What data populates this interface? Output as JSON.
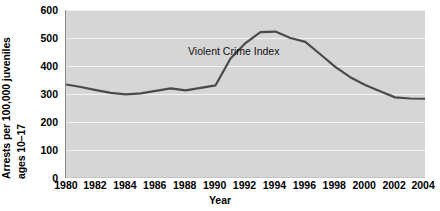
{
  "chart_data": {
    "type": "line",
    "title": "",
    "xlabel": "Year",
    "ylabel_lines": [
      "Arrests per 100,000 juveniles",
      "ages 10–17"
    ],
    "ylabel": "Arrests per 100,000 juveniles ages 10–17",
    "xlim": [
      1980,
      2004
    ],
    "ylim": [
      0,
      600
    ],
    "yticks": [
      600,
      500,
      400,
      300,
      200,
      100,
      0
    ],
    "ytick_labels": [
      "600",
      "500",
      "400",
      "300",
      "200",
      "100",
      "0"
    ],
    "xticks": [
      1980,
      1982,
      1984,
      1986,
      1988,
      1990,
      1992,
      1994,
      1996,
      1998,
      2000,
      2002,
      2004
    ],
    "xtick_labels": [
      "1980",
      "1982",
      "1984",
      "1986",
      "1988",
      "1990",
      "1992",
      "1994",
      "1996",
      "1998",
      "2000",
      "2002",
      "2004"
    ],
    "grid": "horizontal-white-gridlines",
    "legend": "none",
    "annotations": [
      {
        "text": "Violent Crime Index",
        "x": 1986,
        "y": 470
      }
    ],
    "series": [
      {
        "name": "Violent Crime Index",
        "color": "#4a4a4a",
        "x": [
          1980,
          1981,
          1982,
          1983,
          1984,
          1985,
          1986,
          1987,
          1988,
          1989,
          1990,
          1991,
          1992,
          1993,
          1994,
          1995,
          1996,
          1997,
          1998,
          1999,
          2000,
          2001,
          2002,
          2003,
          2004
        ],
        "values": [
          334,
          325,
          314,
          304,
          299,
          302,
          311,
          320,
          313,
          322,
          331,
          427,
          482,
          521,
          523,
          500,
          486,
          442,
          397,
          360,
          332,
          310,
          288,
          284,
          283
        ]
      }
    ]
  },
  "axis_colors": {
    "plot_background": "#d6d6d6",
    "gridline": "#f2f2f2",
    "axis_line": "#8a8a8a",
    "line_color": "#4a4a4a",
    "text": "#000000"
  }
}
